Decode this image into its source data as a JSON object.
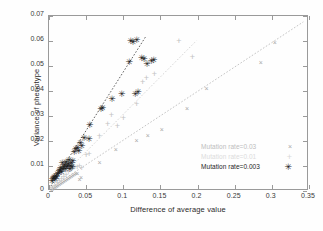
{
  "chart_data": {
    "type": "scatter",
    "title": "",
    "xlabel": "Difference of average value",
    "ylabel": "Variance of phenotype",
    "xlim": [
      0,
      0.35
    ],
    "ylim": [
      0,
      0.07
    ],
    "xticks": [
      "0",
      "0.05",
      "0.1",
      "0.15",
      "0.2",
      "0.25",
      "0.3",
      "0.35"
    ],
    "xtick_values": [
      0,
      0.05,
      0.1,
      0.15,
      0.2,
      0.25,
      0.3,
      0.35
    ],
    "yticks": [
      "0",
      "0.01",
      "0.02",
      "0.03",
      "0.04",
      "0.05",
      "0.06",
      "0.07"
    ],
    "ytick_values": [
      0,
      0.01,
      0.02,
      0.03,
      0.04,
      0.05,
      0.06,
      0.07
    ],
    "grid": false,
    "legend_position": "lower-right",
    "series": [
      {
        "name": "Mutation rate=0.03",
        "marker": "x",
        "color": "#a8a8a8",
        "trend_slope": 0.196,
        "trend_intercept": 0.0,
        "trend_x_range": [
          0.0,
          0.345
        ],
        "points": [
          [
            0.004,
            0.0008
          ],
          [
            0.006,
            0.0012
          ],
          [
            0.008,
            0.0016
          ],
          [
            0.01,
            0.002
          ],
          [
            0.012,
            0.0024
          ],
          [
            0.014,
            0.0027
          ],
          [
            0.016,
            0.0031
          ],
          [
            0.018,
            0.0035
          ],
          [
            0.02,
            0.0039
          ],
          [
            0.022,
            0.0043
          ],
          [
            0.024,
            0.0047
          ],
          [
            0.026,
            0.0051
          ],
          [
            0.028,
            0.0055
          ],
          [
            0.03,
            0.0059
          ],
          [
            0.032,
            0.0063
          ],
          [
            0.034,
            0.0067
          ],
          [
            0.036,
            0.0071
          ],
          [
            0.038,
            0.0074
          ],
          [
            0.041,
            0.005
          ],
          [
            0.043,
            0.0055
          ],
          [
            0.068,
            0.0118
          ],
          [
            0.09,
            0.0168
          ],
          [
            0.118,
            0.0205
          ],
          [
            0.133,
            0.0223
          ],
          [
            0.152,
            0.0248
          ],
          [
            0.186,
            0.0332
          ],
          [
            0.212,
            0.0412
          ],
          [
            0.285,
            0.0516
          ],
          [
            0.304,
            0.0598
          ]
        ]
      },
      {
        "name": "Mutation rate=0.01",
        "marker": "+",
        "color": "#c2c2c2",
        "trend_slope": 0.3,
        "trend_intercept": 0.0,
        "trend_x_range": [
          0.0,
          0.2
        ],
        "points": [
          [
            0.005,
            0.0014
          ],
          [
            0.008,
            0.0022
          ],
          [
            0.011,
            0.0031
          ],
          [
            0.014,
            0.004
          ],
          [
            0.017,
            0.0049
          ],
          [
            0.02,
            0.0057
          ],
          [
            0.023,
            0.0066
          ],
          [
            0.026,
            0.0075
          ],
          [
            0.029,
            0.0084
          ],
          [
            0.032,
            0.0092
          ],
          [
            0.035,
            0.0096
          ],
          [
            0.038,
            0.0098
          ],
          [
            0.041,
            0.01
          ],
          [
            0.044,
            0.0092
          ],
          [
            0.05,
            0.0143
          ],
          [
            0.054,
            0.015
          ],
          [
            0.068,
            0.0221
          ],
          [
            0.079,
            0.0268
          ],
          [
            0.084,
            0.0305
          ],
          [
            0.092,
            0.0262
          ],
          [
            0.1,
            0.0292
          ],
          [
            0.118,
            0.0348
          ],
          [
            0.126,
            0.0437
          ],
          [
            0.131,
            0.0452
          ],
          [
            0.142,
            0.047
          ],
          [
            0.175,
            0.0602
          ],
          [
            0.193,
            0.0538
          ]
        ]
      },
      {
        "name": "Mutation rate=0.003",
        "marker": "*",
        "color": "#1c1c1c",
        "trend_slope": 0.47,
        "trend_intercept": 0.0,
        "trend_x_range": [
          0.0,
          0.132
        ],
        "points": [
          [
            0.004,
            0.004
          ],
          [
            0.005,
            0.0048
          ],
          [
            0.006,
            0.0052
          ],
          [
            0.007,
            0.0058
          ],
          [
            0.008,
            0.005
          ],
          [
            0.009,
            0.0062
          ],
          [
            0.01,
            0.0055
          ],
          [
            0.011,
            0.0068
          ],
          [
            0.013,
            0.0072
          ],
          [
            0.014,
            0.008
          ],
          [
            0.015,
            0.0085
          ],
          [
            0.016,
            0.0092
          ],
          [
            0.017,
            0.0078
          ],
          [
            0.018,
            0.0112
          ],
          [
            0.019,
            0.009
          ],
          [
            0.02,
            0.0098
          ],
          [
            0.021,
            0.0105
          ],
          [
            0.022,
            0.0088
          ],
          [
            0.023,
            0.0118
          ],
          [
            0.024,
            0.0095
          ],
          [
            0.025,
            0.0102
          ],
          [
            0.026,
            0.011
          ],
          [
            0.027,
            0.0125
          ],
          [
            0.028,
            0.009
          ],
          [
            0.029,
            0.01
          ],
          [
            0.03,
            0.0112
          ],
          [
            0.031,
            0.0098
          ],
          [
            0.032,
            0.012
          ],
          [
            0.034,
            0.0155
          ],
          [
            0.036,
            0.0168
          ],
          [
            0.038,
            0.0172
          ],
          [
            0.04,
            0.016
          ],
          [
            0.042,
            0.0192
          ],
          [
            0.044,
            0.0182
          ],
          [
            0.047,
            0.0212
          ],
          [
            0.054,
            0.021
          ],
          [
            0.055,
            0.0265
          ],
          [
            0.07,
            0.0327
          ],
          [
            0.072,
            0.0332
          ],
          [
            0.085,
            0.0368
          ],
          [
            0.098,
            0.0388
          ],
          [
            0.108,
            0.0515
          ],
          [
            0.11,
            0.0601
          ],
          [
            0.113,
            0.0598
          ],
          [
            0.116,
            0.039
          ],
          [
            0.118,
            0.0603
          ],
          [
            0.12,
            0.0398
          ],
          [
            0.125,
            0.0532
          ],
          [
            0.128,
            0.0529
          ],
          [
            0.132,
            0.0508
          ],
          [
            0.138,
            0.0521
          ],
          [
            0.141,
            0.0523
          ]
        ]
      }
    ]
  },
  "legend": {
    "entries": [
      {
        "label": "Mutation rate=0.03",
        "glyph": "×"
      },
      {
        "label": "Mutation rate=0.01",
        "glyph": "+"
      },
      {
        "label": "Mutation rate=0.003",
        "glyph": "✳"
      }
    ]
  },
  "axes": {
    "x_title": "Difference of average value",
    "y_title": "Variance of phenotype"
  }
}
